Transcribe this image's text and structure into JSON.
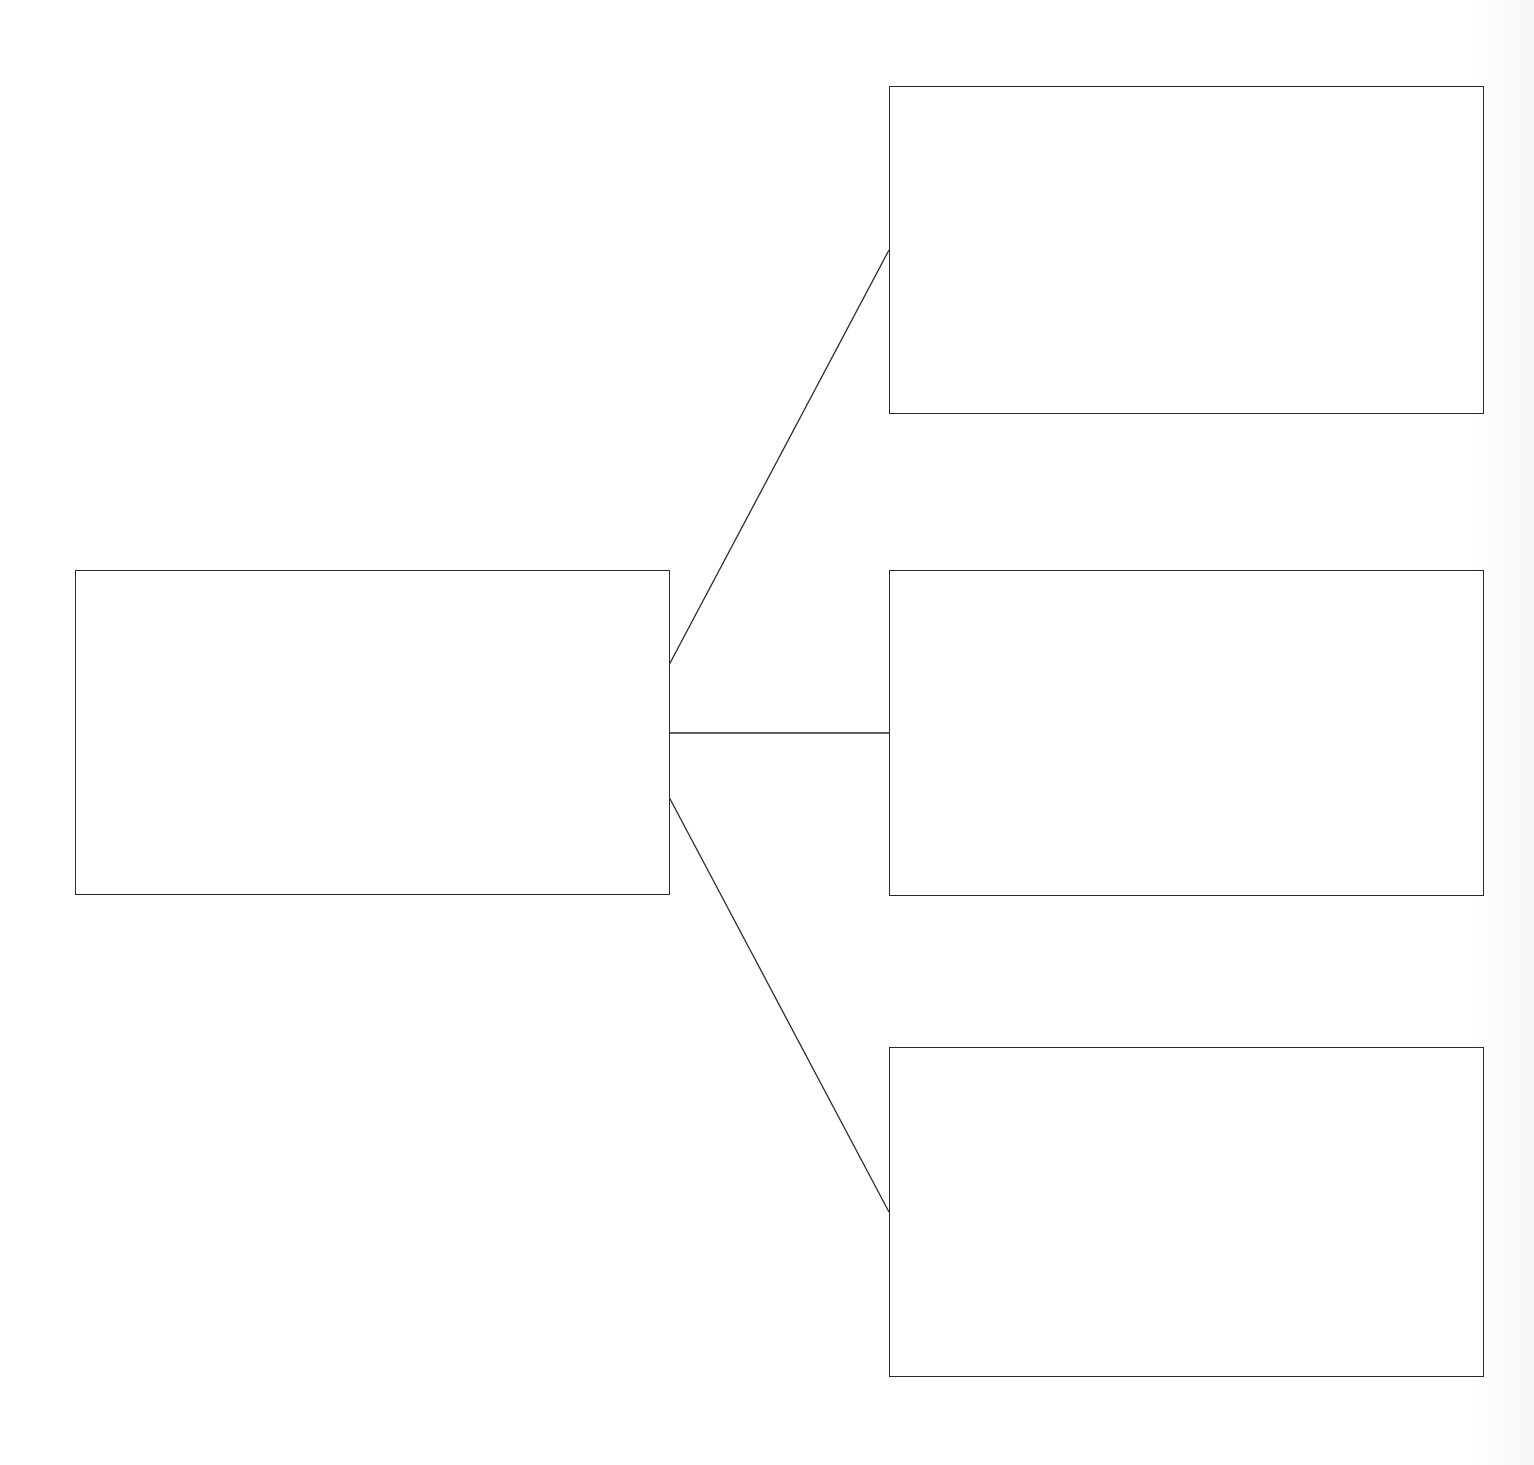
{
  "diagram": {
    "type": "tree",
    "orientation": "left-to-right",
    "line_color": "#2a2a2a",
    "background_color": "#ffffff",
    "nodes": [
      {
        "id": "root",
        "label": "",
        "x": 75,
        "y": 570,
        "w": 595,
        "h": 325
      },
      {
        "id": "child-1",
        "label": "",
        "x": 889,
        "y": 86,
        "w": 595,
        "h": 328
      },
      {
        "id": "child-2",
        "label": "",
        "x": 889,
        "y": 570,
        "w": 595,
        "h": 326
      },
      {
        "id": "child-3",
        "label": "",
        "x": 889,
        "y": 1047,
        "w": 595,
        "h": 330
      }
    ],
    "edges": [
      {
        "from": "root",
        "to": "child-1",
        "x1": 669,
        "y1": 665,
        "x2": 889,
        "y2": 250
      },
      {
        "from": "root",
        "to": "child-2",
        "x1": 669,
        "y1": 733,
        "x2": 889,
        "y2": 733
      },
      {
        "from": "root",
        "to": "child-3",
        "x1": 669,
        "y1": 797,
        "x2": 889,
        "y2": 1212
      }
    ]
  }
}
